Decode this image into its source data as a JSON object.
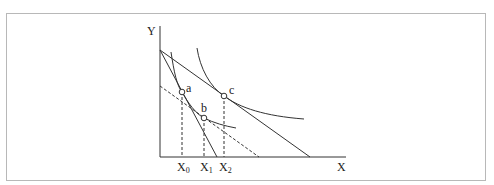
{
  "diagram": {
    "axes": {
      "y_label": "Y",
      "x_label": "X"
    },
    "points": [
      {
        "id": "a",
        "label": "a"
      },
      {
        "id": "b",
        "label": "b"
      },
      {
        "id": "c",
        "label": "c"
      }
    ],
    "x_ticks": [
      {
        "base": "X",
        "sub": "0"
      },
      {
        "base": "X",
        "sub": "1"
      },
      {
        "base": "X",
        "sub": "2"
      }
    ],
    "colors": {
      "line": "#333333",
      "frame": "#b8b8b8"
    }
  }
}
